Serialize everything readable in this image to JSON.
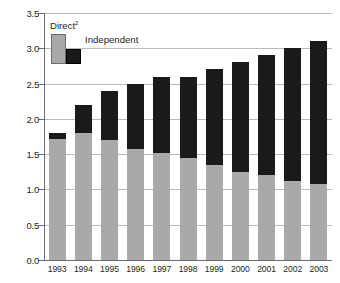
{
  "chart_data": {
    "type": "bar",
    "subtype": "stacked-vertical",
    "title": "",
    "xlabel": "",
    "ylabel": "",
    "ylim": [
      0.0,
      3.5
    ],
    "ytick_step": 0.5,
    "grid": true,
    "legend_position": "top-left-inside",
    "categories": [
      "1993",
      "1994",
      "1995",
      "1996",
      "1997",
      "1998",
      "1999",
      "2000",
      "2001",
      "2002",
      "2003"
    ],
    "ytick_labels": [
      "0.0",
      "0.5",
      "1.0",
      "1.5",
      "2.0",
      "2.5",
      "3.0",
      "3.5"
    ],
    "ytick_values": [
      0.0,
      0.5,
      1.0,
      1.5,
      2.0,
      2.5,
      3.0,
      3.5
    ],
    "series": [
      {
        "name": "Direct",
        "color": "#a9a9a9",
        "values": [
          1.72,
          1.8,
          1.7,
          1.58,
          1.52,
          1.45,
          1.35,
          1.25,
          1.2,
          1.12,
          1.08
        ]
      },
      {
        "name": "Independent",
        "color": "#1a1a1a",
        "values": [
          0.08,
          0.4,
          0.7,
          0.92,
          1.08,
          1.15,
          1.35,
          1.55,
          1.7,
          1.88,
          2.02
        ]
      }
    ],
    "totals": [
      1.8,
      2.2,
      2.4,
      2.5,
      2.6,
      2.6,
      2.7,
      2.8,
      2.9,
      3.0,
      3.1
    ]
  },
  "legend": {
    "direct_label": "Direct",
    "direct_superscript": "2",
    "independent_label": "Independent"
  },
  "colors": {
    "direct": "#a9a9a9",
    "independent": "#1a1a1a",
    "grid": "#b9b9b9",
    "axis": "#6e6e6e",
    "text": "#231f20",
    "background": "#ffffff"
  }
}
